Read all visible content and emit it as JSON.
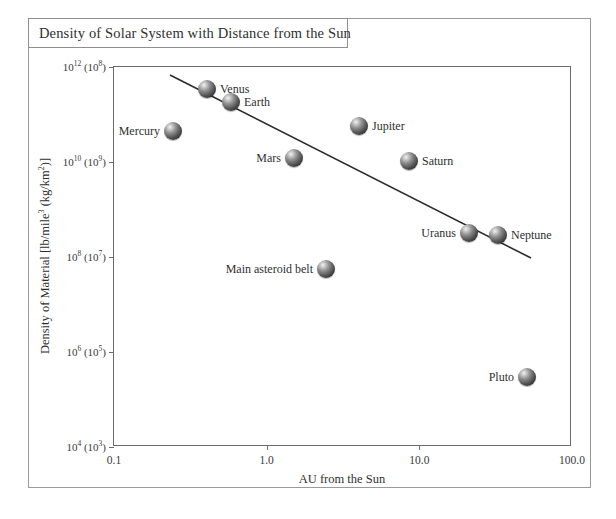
{
  "figure": {
    "title": "Density of Solar System with Distance from the Sun"
  },
  "chart_data": {
    "type": "scatter",
    "title": "Density of Solar System with Distance from the Sun",
    "xlabel": "AU from the Sun",
    "ylabel": "Density of Material [lb/mile³ (kg/km²)]",
    "x_scale": "log",
    "y_scale": "log",
    "xlim": [
      0.1,
      100.0
    ],
    "ylim": [
      10000.0,
      1000000000000.0
    ],
    "grid": false,
    "legend": "none",
    "x_ticks": [
      {
        "value": 0.1,
        "label": "0.1"
      },
      {
        "value": 1.0,
        "label": "1.0"
      },
      {
        "value": 10.0,
        "label": "10.0"
      },
      {
        "value": 100.0,
        "label": "100.0"
      }
    ],
    "y_ticks": [
      {
        "value": 1000000000000.0,
        "label": "10",
        "exp": "12",
        "alt_label": "(10",
        "alt_exp": "8",
        "full": "10¹² (10⁸)"
      },
      {
        "value": 10000000000.0,
        "label": "10",
        "exp": "10",
        "alt_label": "(10",
        "alt_exp": "9",
        "full": "10¹⁰ (10⁹)"
      },
      {
        "value": 100000000.0,
        "label": "10",
        "exp": "8",
        "alt_label": "(10",
        "alt_exp": "7",
        "full": "10⁸ (10⁷)"
      },
      {
        "value": 1000000.0,
        "label": "10",
        "exp": "6",
        "alt_label": "(10",
        "alt_exp": "5",
        "full": "10⁶ (10⁵)"
      },
      {
        "value": 10000.0,
        "label": "10",
        "exp": "4",
        "alt_label": "(10",
        "alt_exp": "3",
        "full": "10⁴ (10³)"
      }
    ],
    "points": [
      {
        "name": "Mercury",
        "x": 0.39,
        "y": 220000000000.0,
        "px": 172,
        "py": 130,
        "label_side": "left"
      },
      {
        "name": "Venus",
        "x": 0.72,
        "y": 630000000000.0,
        "px": 206,
        "py": 88,
        "label_side": "right"
      },
      {
        "name": "Earth",
        "x": 1.0,
        "y": 450000000000.0,
        "px": 230,
        "py": 101,
        "label_side": "right"
      },
      {
        "name": "Mars",
        "x": 1.52,
        "y": 11000000000.0,
        "px": 293,
        "py": 157,
        "label_side": "left"
      },
      {
        "name": "Main asteroid belt",
        "x": 2.8,
        "y": 300000000.0,
        "px": 325,
        "py": 268,
        "label_side": "left"
      },
      {
        "name": "Jupiter",
        "x": 5.2,
        "y": 200000000000.0,
        "px": 358,
        "py": 125,
        "label_side": "right"
      },
      {
        "name": "Saturn",
        "x": 9.5,
        "y": 10000000000.0,
        "px": 408,
        "py": 160,
        "label_side": "right"
      },
      {
        "name": "Uranus",
        "x": 19.2,
        "y": 35000000.0,
        "px": 468,
        "py": 232,
        "label_side": "left"
      },
      {
        "name": "Neptune",
        "x": 30.1,
        "y": 30000000.0,
        "px": 497,
        "py": 234,
        "label_side": "right"
      },
      {
        "name": "Pluto",
        "x": 39.5,
        "y": 400000.0,
        "px": 526,
        "py": 376,
        "label_side": "left"
      }
    ],
    "trend_line": {
      "label": "fitted decline",
      "x1": 169,
      "y1": 74,
      "x2": 530,
      "y2": 257,
      "color": "#2b2b2b"
    }
  },
  "colors": {
    "frame": "#9a9a9a",
    "axis": "#6b6b6b",
    "text": "#2f2f2f",
    "sphere_dark": "#262626",
    "sphere_light": "#f2f2f2"
  }
}
